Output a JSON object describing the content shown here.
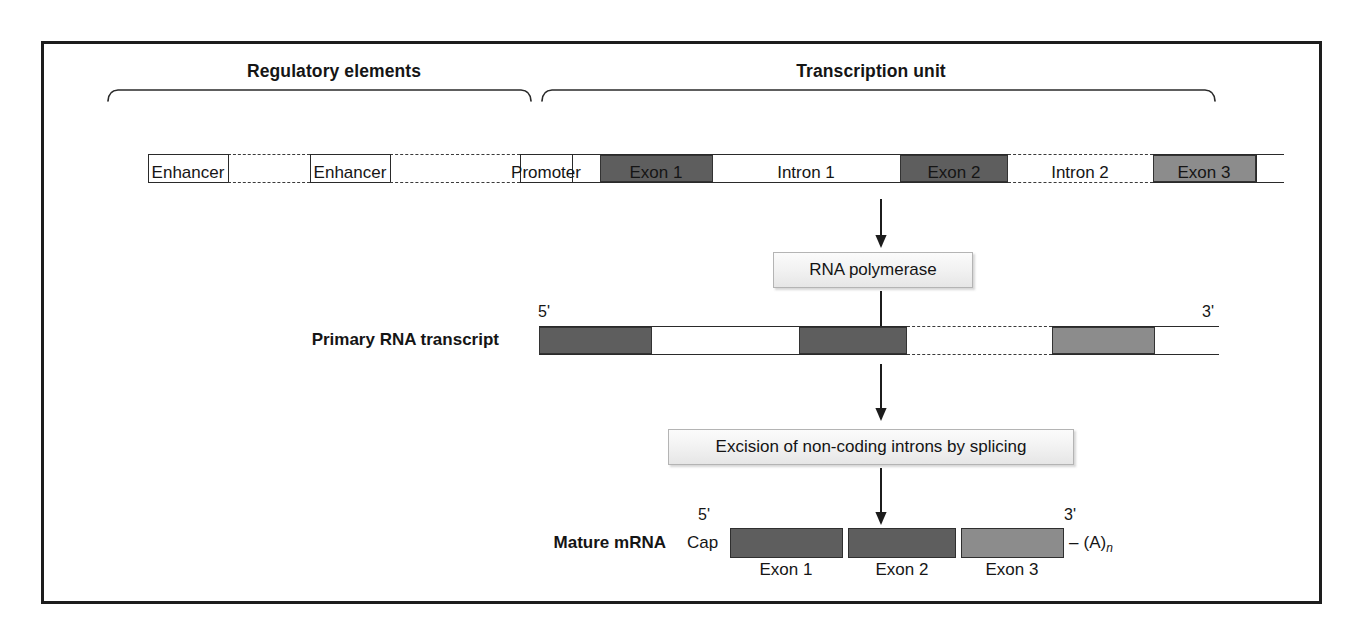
{
  "figure": {
    "colors": {
      "exon_dark": "#5e5e5e",
      "exon_light": "#8c8c8c",
      "line": "#2a2a2a",
      "frame": "#1d1d1d",
      "box_fill": "#f0f0f0"
    }
  },
  "gene_row": {
    "brackets": [
      {
        "label": "Regulatory elements"
      },
      {
        "label": "Transcription unit"
      }
    ],
    "segments": [
      {
        "name": "Enhancer",
        "type": "box",
        "label": "Enhancer"
      },
      {
        "name": "Enhancer",
        "type": "box",
        "label": "Enhancer"
      },
      {
        "name": "Promoter",
        "type": "box",
        "label": "Promoter"
      },
      {
        "name": "Exon 1",
        "type": "exon",
        "label": "Exon 1",
        "shade": "dark"
      },
      {
        "name": "Intron 1",
        "type": "intron",
        "label": "Intron 1"
      },
      {
        "name": "Exon 2",
        "type": "exon",
        "label": "Exon 2",
        "shade": "dark"
      },
      {
        "name": "Intron 2",
        "type": "intron",
        "label": "Intron 2"
      },
      {
        "name": "Exon 3",
        "type": "exon",
        "label": "Exon 3",
        "shade": "light"
      }
    ]
  },
  "steps": [
    {
      "label": "RNA polymerase"
    },
    {
      "label": "Excision of non-coding introns by splicing"
    }
  ],
  "transcript": {
    "row_label": "Primary RNA transcript",
    "five_prime": "5'",
    "three_prime": "3'",
    "segments": [
      {
        "name": "Exon 1",
        "type": "exon",
        "shade": "dark"
      },
      {
        "name": "Intron 1",
        "type": "intron"
      },
      {
        "name": "Exon 2",
        "type": "exon",
        "shade": "dark"
      },
      {
        "name": "Intron 2",
        "type": "intron"
      },
      {
        "name": "Exon 3",
        "type": "exon",
        "shade": "light"
      }
    ]
  },
  "mature_mrna": {
    "row_label": "Mature mRNA",
    "cap_label": "Cap",
    "five_prime": "5'",
    "three_prime": "3'",
    "poly_a_dash": "–",
    "poly_a_open": "(A)",
    "poly_a_sub": "n",
    "exons": [
      {
        "label": "Exon 1",
        "shade": "dark"
      },
      {
        "label": "Exon 2",
        "shade": "dark"
      },
      {
        "label": "Exon 3",
        "shade": "light"
      }
    ]
  }
}
